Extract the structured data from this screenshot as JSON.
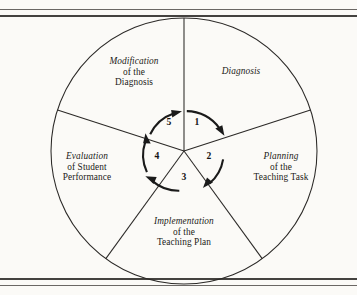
{
  "figure": {
    "shape": "circle-divided-into-five-sectors",
    "direction": "clockwise",
    "border_style": "double-horizontal-rule",
    "colors": {
      "page_background": "#fbfaf7",
      "ink": "#1b1a18",
      "rule": "#44423f"
    }
  },
  "sectors": [
    {
      "number": "1",
      "line1": "Diagnosis",
      "line2": "",
      "line3": "",
      "position": "upper-right"
    },
    {
      "number": "2",
      "line1": "Planning",
      "line2": "of the",
      "line3": "Teaching Task",
      "position": "right"
    },
    {
      "number": "3",
      "line1": "Implementation",
      "line2": "of the",
      "line3": "Teaching Plan",
      "position": "bottom"
    },
    {
      "number": "4",
      "line1": "Evaluation",
      "line2": "of Student",
      "line3": "Performance",
      "position": "left"
    },
    {
      "number": "5",
      "line1": "Modification",
      "line2": "of the",
      "line3": "Diagnosis",
      "position": "upper-left"
    }
  ],
  "inner_numbers": [
    "1",
    "2",
    "3",
    "4",
    "5"
  ]
}
